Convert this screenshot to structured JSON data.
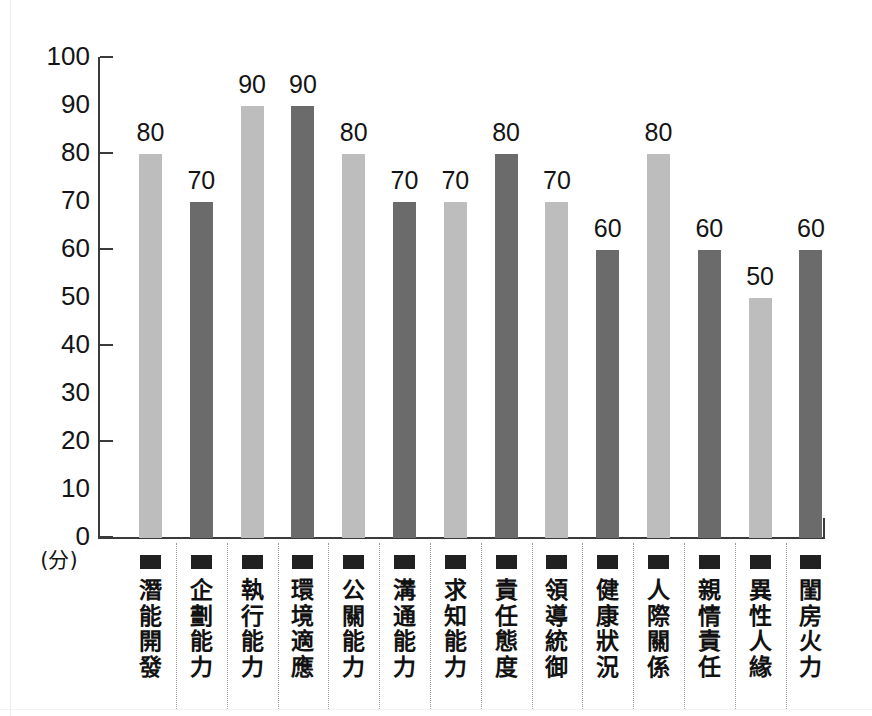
{
  "chart_data": {
    "type": "bar",
    "title": "",
    "subtitle": "",
    "xlabel": "",
    "ylabel": "(分)",
    "ylim": [
      0,
      100
    ],
    "ytick_values": [
      100,
      90,
      80,
      70,
      60,
      50,
      40,
      30,
      20,
      10,
      0
    ],
    "ytick_labels": [
      "100",
      "90",
      "80",
      "70",
      "60",
      "50",
      "40",
      "30",
      "20",
      "10",
      "0"
    ],
    "major_tick_values": [
      100,
      80,
      60,
      40,
      20,
      0
    ],
    "grid": false,
    "legend": "none",
    "categories": [
      "潛能開發",
      "企劃能力",
      "執行能力",
      "環境適應",
      "公關能力",
      "溝通能力",
      "求知能力",
      "責任態度",
      "領導統御",
      "健康狀況",
      "人際關係",
      "親情責任",
      "異性人緣",
      "閨房火力"
    ],
    "values": [
      80,
      70,
      90,
      90,
      80,
      70,
      70,
      80,
      70,
      60,
      80,
      60,
      50,
      60
    ],
    "value_labels": [
      "80",
      "70",
      "90",
      "90",
      "80",
      "70",
      "70",
      "80",
      "70",
      "60",
      "80",
      "60",
      "50",
      "60"
    ],
    "bar_colors": [
      "#bdbdbd",
      "#6b6b6b",
      "#bdbdbd",
      "#6b6b6b",
      "#bdbdbd",
      "#6b6b6b",
      "#bdbdbd",
      "#6b6b6b",
      "#bdbdbd",
      "#6b6b6b",
      "#bdbdbd",
      "#6b6b6b",
      "#bdbdbd",
      "#6b6b6b"
    ],
    "colors": {
      "light_bar": "#bdbdbd",
      "dark_bar": "#6b6b6b",
      "axis": "#3a3a3a",
      "text": "#141414",
      "divider": "#9a9a9a",
      "marker": "#212121",
      "background": "#ffffff"
    }
  }
}
